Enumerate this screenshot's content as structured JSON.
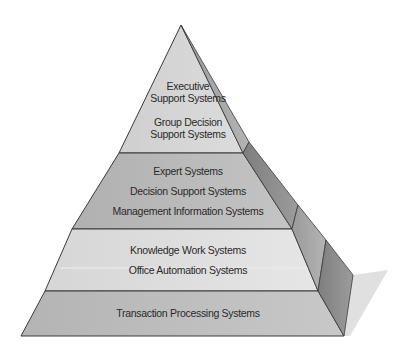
{
  "diagram": {
    "type": "pyramid",
    "levels": [
      {
        "name": "strategic",
        "fill": "#d4d4d4",
        "labels": [
          "Executive",
          "Support Systems",
          "Group Decision",
          "Support Systems"
        ]
      },
      {
        "name": "management",
        "fill": "#b9b9b9",
        "labels": [
          "Expert Systems",
          "Decision Support Systems",
          "Management Information Systems"
        ]
      },
      {
        "name": "knowledge",
        "fill": "#dedede",
        "labels": [
          "Knowledge Work Systems",
          "Office Automation Systems"
        ]
      },
      {
        "name": "operational",
        "fill": "#bdbdbd",
        "labels": [
          "Transaction Processing Systems"
        ]
      }
    ],
    "colors": {
      "outline": "#3a3a3a",
      "side_face_dark": "#8a8a8a",
      "side_face_light": "#a6a6a6",
      "shadow": "#e2e2e2",
      "text": "#2a2a2a"
    }
  }
}
